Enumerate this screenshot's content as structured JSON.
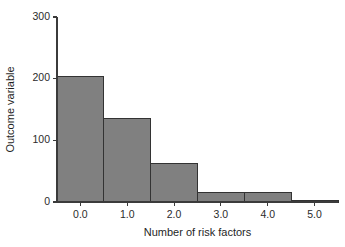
{
  "chart_data": {
    "type": "bar",
    "title": "",
    "subtitle": "",
    "xlabel": "Number of risk factors",
    "ylabel": "Outcome variable",
    "categories": [
      "0.0",
      "1.0",
      "2.0",
      "3.0",
      "4.0",
      "5.0"
    ],
    "x": [
      0,
      1,
      2,
      3,
      4,
      5
    ],
    "values": [
      203,
      136,
      63,
      16,
      16,
      3
    ],
    "bar_width": 1.0,
    "xlim": [
      -0.5,
      5.5
    ],
    "ylim": [
      0,
      300
    ],
    "xticks": [
      0,
      1,
      2,
      3,
      4,
      5
    ],
    "xtick_labels": [
      "0.0",
      "1.0",
      "2.0",
      "3.0",
      "4.0",
      "5.0"
    ],
    "yticks": [
      0,
      100,
      200,
      300
    ],
    "ytick_labels": [
      "0",
      "100",
      "200",
      "300"
    ],
    "grid": false,
    "legend": null,
    "annotations": [],
    "colors": {
      "bar_fill": "#808080",
      "bar_edge": "#333333",
      "axis": "#3b3b3b",
      "text": "#1f1f1f",
      "background": "#ffffff"
    }
  },
  "layout": {
    "plot_left": 57,
    "plot_right": 338,
    "plot_top": 17,
    "plot_bottom": 202,
    "tick_len": 4,
    "ylabel_x": 14,
    "xlabel_y": 236
  }
}
